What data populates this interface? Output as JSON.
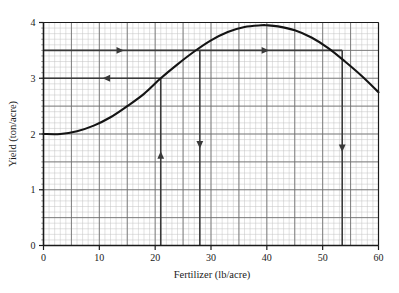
{
  "chart_data": {
    "type": "line",
    "title": "",
    "xlabel": "Fertilizer (lb/acre)",
    "ylabel": "Yield (ton/acre)",
    "xlim": [
      0,
      60
    ],
    "ylim": [
      0,
      4
    ],
    "xticks": [
      0,
      10,
      20,
      30,
      40,
      50,
      60
    ],
    "xtick_labels": [
      "0",
      "10",
      "20",
      "30",
      "40",
      "50",
      "60"
    ],
    "yticks": [
      0,
      1,
      2,
      3,
      4
    ],
    "ytick_labels": [
      "0",
      "1",
      "2",
      "3",
      "4"
    ],
    "grid": true,
    "grid_major_x": 5,
    "grid_major_y": 0.5,
    "grid_minor_x": 1,
    "grid_minor_y": 0.1,
    "legend": "none",
    "series": [
      {
        "name": "yield-curve",
        "x": [
          0,
          3,
          6,
          9,
          12,
          15,
          18,
          21,
          24,
          27,
          30,
          33,
          36,
          39,
          40,
          42,
          45,
          48,
          51,
          54,
          57,
          60
        ],
        "y": [
          2.0,
          2.0,
          2.05,
          2.15,
          2.3,
          2.5,
          2.72,
          3.0,
          3.25,
          3.48,
          3.68,
          3.83,
          3.92,
          3.95,
          3.95,
          3.93,
          3.86,
          3.73,
          3.54,
          3.3,
          3.04,
          2.75
        ]
      }
    ],
    "annotations": [
      {
        "name": "guide-y-3-horizontal",
        "type": "horizontal-guide",
        "y": 3.0,
        "x_from": 0,
        "x_to": 21,
        "arrow": "left",
        "arrow_at_x": 11
      },
      {
        "name": "guide-x-21-vertical",
        "type": "vertical-guide",
        "x": 21,
        "y_from": 0,
        "y_to": 3.0,
        "arrow": "up",
        "arrow_at_y": 1.65
      },
      {
        "name": "guide-x-28-vertical",
        "type": "vertical-guide",
        "x": 28,
        "y_from": 0,
        "y_to": 3.5,
        "arrow": "down",
        "arrow_at_y": 1.78
      },
      {
        "name": "guide-y-3p5-horizontal",
        "type": "horizontal-guide",
        "y": 3.5,
        "x_from": 0,
        "x_to": 53.5,
        "arrow": "right",
        "arrow_at_x": 14
      },
      {
        "name": "guide-y-3p5-marker-right",
        "type": "horizontal-guide-marker",
        "y": 3.5,
        "arrow": "right",
        "arrow_at_x": 40
      },
      {
        "name": "guide-x-53p5-vertical",
        "type": "vertical-guide",
        "x": 53.5,
        "y_from": 0,
        "y_to": 3.5,
        "arrow": "down",
        "arrow_at_y": 1.72
      }
    ],
    "colors": {
      "curve": "#141414",
      "guide": "#3a3a3a",
      "axis": "#1a1a1a",
      "grid_major": "#6e6e6e",
      "grid_minor": "#c2c2c2",
      "background": "#ffffff"
    }
  }
}
